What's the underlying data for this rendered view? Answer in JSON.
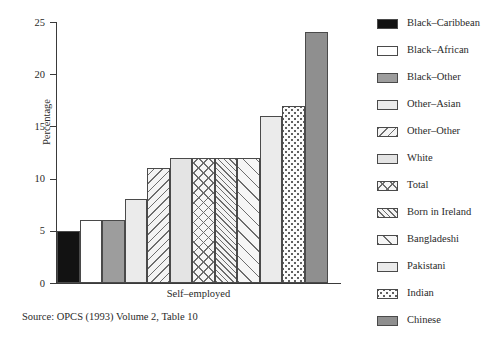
{
  "chart_data": {
    "type": "bar",
    "title": "",
    "xlabel": "Self–employed",
    "ylabel": "Percentage",
    "ylim": [
      0,
      25
    ],
    "ytick_labels": [
      "0",
      "5",
      "10",
      "15",
      "20",
      "25"
    ],
    "ytick_values": [
      0,
      5,
      10,
      15,
      20,
      25
    ],
    "grid": false,
    "legend_position": "right",
    "categories": [
      "Black–Caribbean",
      "Black–African",
      "Black–Other",
      "Other–Asian",
      "Other–Other",
      "White",
      "Total",
      "Born in Ireland",
      "Bangladeshi",
      "Pakistani",
      "Indian",
      "Chinese"
    ],
    "values": [
      5,
      6,
      6,
      8,
      11,
      12,
      12,
      12,
      12,
      16,
      17,
      24
    ],
    "bar_patterns": [
      "solid-black",
      "white",
      "gray-mid",
      "gray-light",
      "diag-left",
      "gray-light2",
      "crosshatch",
      "diag-right-dense",
      "diag-right-wide",
      "gray-light",
      "dotted",
      "gray-dark"
    ],
    "source_note": "Source: OPCS (1993) Volume 2, Table 10"
  },
  "legend": {
    "items": [
      {
        "label": "Black–Caribbean",
        "pattern": "solid-black"
      },
      {
        "label": "Black–African",
        "pattern": "white"
      },
      {
        "label": "Black–Other",
        "pattern": "gray-mid"
      },
      {
        "label": "Other–Asian",
        "pattern": "gray-light"
      },
      {
        "label": "Other–Other",
        "pattern": "diag-left"
      },
      {
        "label": "White",
        "pattern": "gray-light2"
      },
      {
        "label": "Total",
        "pattern": "crosshatch"
      },
      {
        "label": "Born in Ireland",
        "pattern": "diag-right-dense"
      },
      {
        "label": "Bangladeshi",
        "pattern": "diag-right-wide"
      },
      {
        "label": "Pakistani",
        "pattern": "gray-light"
      },
      {
        "label": "Indian",
        "pattern": "dotted"
      },
      {
        "label": "Chinese",
        "pattern": "gray-dark"
      }
    ]
  }
}
